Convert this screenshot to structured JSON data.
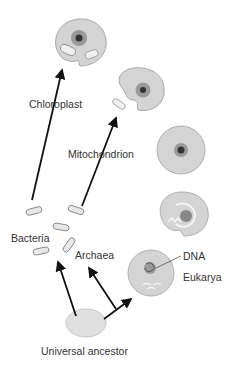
{
  "diagram": {
    "labels": {
      "chloroplast": "Chloroplast",
      "mitochondrion": "Mitochondrion",
      "bacteria": "Bacteria",
      "archaea": "Archaea",
      "dna": "DNA",
      "eukarya": "Eukarya",
      "universal_ancestor": "Universal ancestor"
    },
    "nodes": [
      {
        "id": "universal-ancestor",
        "label": "Universal ancestor"
      },
      {
        "id": "bacteria",
        "label": "Bacteria"
      },
      {
        "id": "archaea",
        "label": "Archaea"
      },
      {
        "id": "eukarya-cell",
        "label": "Eukarya"
      },
      {
        "id": "nucleus-forming-cell",
        "label": ""
      },
      {
        "id": "nucleated-cell",
        "label": ""
      },
      {
        "id": "cell-with-mitochondrion",
        "label": ""
      },
      {
        "id": "cell-with-chloroplast",
        "label": ""
      }
    ],
    "edges": [
      {
        "from": "universal-ancestor",
        "to": "bacteria"
      },
      {
        "from": "universal-ancestor",
        "to": "archaea"
      },
      {
        "from": "universal-ancestor",
        "to": "eukarya-cell"
      },
      {
        "from": "bacteria",
        "to": "cell-with-mitochondrion",
        "label": "Mitochondrion"
      },
      {
        "from": "bacteria",
        "to": "cell-with-chloroplast",
        "label": "Chloroplast"
      }
    ],
    "colors": {
      "cell_fill": "#d4d4d4",
      "cell_stroke": "#a8a8a8",
      "nucleus_ring": "#9a9a9a",
      "nucleus_core": "#333333",
      "arrow": "#111111",
      "ancestor_fill": "#e0e0e0",
      "text": "#333333"
    }
  }
}
